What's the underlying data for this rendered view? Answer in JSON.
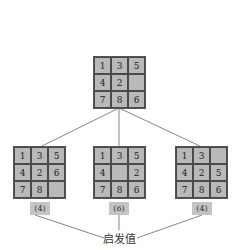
{
  "diagram": {
    "root": {
      "cells": [
        "1",
        "3",
        "5",
        "4",
        "2",
        "",
        "7",
        "8",
        "6"
      ]
    },
    "children": [
      {
        "cells": [
          "1",
          "3",
          "5",
          "4",
          "2",
          "6",
          "7",
          "8",
          ""
        ],
        "heuristic": "(4)"
      },
      {
        "cells": [
          "1",
          "3",
          "5",
          "4",
          "",
          "2",
          "7",
          "8",
          "6"
        ],
        "heuristic": "(6)"
      },
      {
        "cells": [
          "1",
          "3",
          "",
          "4",
          "2",
          "5",
          "7",
          "8",
          "6"
        ],
        "heuristic": "(4)"
      }
    ],
    "caption": "启发值"
  },
  "colors": {
    "tile": "#b9b9b9",
    "label_bg": "#c4c4c4",
    "line": "#555555"
  }
}
